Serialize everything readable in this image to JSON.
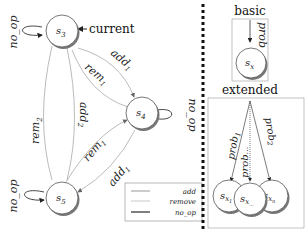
{
  "left_diagram": {
    "states": [
      {
        "id": "s3",
        "label": "s",
        "sub": "3"
      },
      {
        "id": "s4",
        "label": "s",
        "sub": "4"
      },
      {
        "id": "s5",
        "label": "s",
        "sub": "5"
      }
    ],
    "current_label": "current",
    "edges": {
      "s3_loop": "no_op",
      "s4_loop": "no_op",
      "s5_loop": "no_op",
      "s3_s4_add": "add",
      "s3_s4_add_sub": "1",
      "s4_s3_rem": "rem",
      "s4_s3_rem_sub": "1",
      "s3_s5_rem": "rem",
      "s3_s5_rem_sub": "2",
      "s5_s3_add": "add",
      "s5_s3_add_sub": "2",
      "s5_s4_rem": "rem",
      "s5_s4_rem_sub": "1",
      "s4_s5_add": "add",
      "s4_s5_add_sub": "1"
    },
    "legend": {
      "items": [
        {
          "label": "add"
        },
        {
          "label": "remove"
        },
        {
          "label": "no_op"
        }
      ]
    }
  },
  "right_diagram": {
    "basic": {
      "title": "basic",
      "edge_label": "prob",
      "state_label": "s",
      "state_sub": "x"
    },
    "extended": {
      "title": "extended",
      "edges": [
        {
          "label": "prob",
          "sub": "1"
        },
        {
          "label": "prob",
          "sub": "..."
        },
        {
          "label": "prob",
          "sub": "2"
        }
      ],
      "states": [
        {
          "label": "s",
          "sub": "x",
          "subsub": "1"
        },
        {
          "label": "s",
          "sub": "x",
          "subsub": "..."
        },
        {
          "label": "s",
          "sub": "x",
          "subsub": "n"
        }
      ]
    }
  },
  "colors": {
    "edge": "#999999",
    "node_stroke": "#555555",
    "shadow": "#888888",
    "divider": "#111111"
  }
}
